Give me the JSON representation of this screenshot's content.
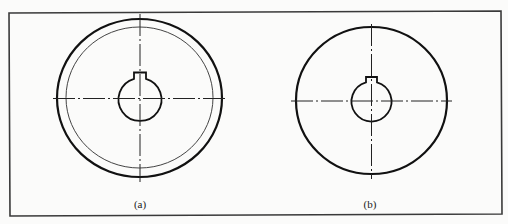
{
  "figure": {
    "colors": {
      "background": "#fbfbfa",
      "line": "#111111",
      "frame": "#3a3a3a"
    },
    "views": [
      {
        "id": "a",
        "label": "(a)",
        "features": [
          "outer circle (thick)",
          "inner circle (thin)",
          "keyed hub bore",
          "dash-dot centerlines"
        ]
      },
      {
        "id": "b",
        "label": "(b)",
        "features": [
          "outer circle (thick)",
          "keyed hub bore",
          "dash-dot centerlines"
        ]
      }
    ]
  }
}
